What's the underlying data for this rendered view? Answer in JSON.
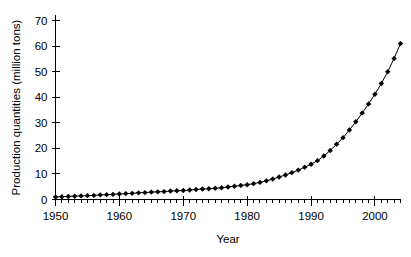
{
  "chart_data": {
    "type": "line",
    "title": "",
    "subtitle": "",
    "xlabel": "Year",
    "ylabel": "Production quantities (million tons)",
    "xlim": [
      1950,
      2004
    ],
    "ylim": [
      0,
      72
    ],
    "xticks": [
      1950,
      1960,
      1970,
      1980,
      1990,
      2000
    ],
    "xtick_labels": [
      "1950",
      "1960",
      "1970",
      "1980",
      "1990",
      "2000"
    ],
    "yticks": [
      0,
      10,
      20,
      30,
      40,
      50,
      60,
      70
    ],
    "ytick_labels": [
      "0",
      "10",
      "20",
      "30",
      "40",
      "50",
      "60",
      "70"
    ],
    "x_minor_tick_step": 1,
    "grid": false,
    "legend": false,
    "legend_position": "none",
    "marker": "diamond",
    "marker_color": "#000000",
    "line_color": "#000000",
    "background_color": "#ffffff",
    "series": [
      {
        "name": "Production quantities",
        "x": [
          1950,
          1951,
          1952,
          1953,
          1954,
          1955,
          1956,
          1957,
          1958,
          1959,
          1960,
          1961,
          1962,
          1963,
          1964,
          1965,
          1966,
          1967,
          1968,
          1969,
          1970,
          1971,
          1972,
          1973,
          1974,
          1975,
          1976,
          1977,
          1978,
          1979,
          1980,
          1981,
          1982,
          1983,
          1984,
          1985,
          1986,
          1987,
          1988,
          1989,
          1990,
          1991,
          1992,
          1993,
          1994,
          1995,
          1996,
          1997,
          1998,
          1999,
          2000,
          2001,
          2002,
          2003,
          2004
        ],
        "values": [
          1.0,
          1.1,
          1.2,
          1.3,
          1.4,
          1.5,
          1.6,
          1.8,
          1.9,
          2.0,
          2.2,
          2.3,
          2.4,
          2.6,
          2.7,
          2.9,
          3.0,
          3.1,
          3.3,
          3.4,
          3.5,
          3.7,
          3.9,
          4.1,
          4.2,
          4.4,
          4.6,
          4.9,
          5.2,
          5.5,
          5.8,
          6.2,
          6.7,
          7.3,
          8.0,
          8.8,
          9.6,
          10.5,
          11.5,
          12.6,
          13.8,
          15.2,
          17.0,
          19.2,
          21.6,
          24.2,
          27.2,
          30.4,
          33.8,
          37.4,
          41.2,
          45.4,
          50.0,
          55.2,
          61.0
        ]
      }
    ]
  }
}
